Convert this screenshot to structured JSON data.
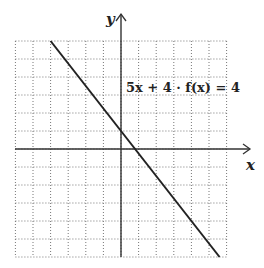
{
  "chart_data": {
    "type": "line",
    "title": "",
    "xlabel": "x",
    "ylabel": "y",
    "xlim": [
      -6,
      6
    ],
    "ylim": [
      -6,
      6
    ],
    "grid": true,
    "grid_style": "dotted",
    "tick_labels": false,
    "series": [
      {
        "name": "5x + 4 · f(x) = 4",
        "equation": "f(x) = 1 - 1.25x",
        "x": [
          -4,
          0,
          0.8,
          5.6
        ],
        "y": [
          6,
          1,
          0,
          -6
        ]
      }
    ],
    "annotations": [
      {
        "text": "5x + 4 · f(x) = 4",
        "x": 0.5,
        "y": 3.4
      }
    ]
  },
  "labels": {
    "x_axis": "x",
    "y_axis": "y",
    "equation": "5x + 4 · f(x) = 4"
  }
}
